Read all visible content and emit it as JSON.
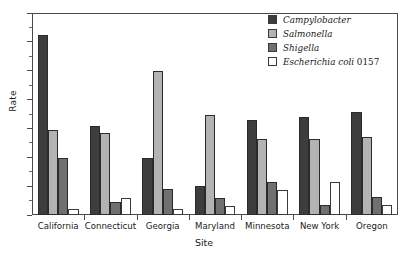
{
  "chart_data": {
    "type": "bar",
    "title": "",
    "xlabel": "Site",
    "ylabel": "Rate",
    "categories": [
      "California",
      "Connecticut",
      "Georgia",
      "Maryland",
      "Minnesota",
      "New York",
      "Oregon"
    ],
    "series": [
      {
        "name": "Campylobacter",
        "color": "#3d3d3d",
        "values": [
          31.2,
          15.5,
          9.8,
          5.0,
          16.5,
          17.0,
          17.8
        ]
      },
      {
        "name": "Salmonella",
        "color": "#b3b3b3",
        "values": [
          14.7,
          14.2,
          25.0,
          17.3,
          13.2,
          13.2,
          13.5
        ]
      },
      {
        "name": "Shigella",
        "color": "#707070",
        "values": [
          9.8,
          2.2,
          4.5,
          3.0,
          5.8,
          1.8,
          3.2
        ]
      },
      {
        "name": "Escherichia coli 0157",
        "color": "#ffffff",
        "values": [
          1.0,
          3.0,
          1.0,
          1.5,
          4.3,
          5.8,
          1.8
        ]
      }
    ],
    "ylim": [
      0,
      35
    ],
    "ytick_labels": [
      "0",
      "5",
      "10",
      "15",
      "20",
      "25",
      "30",
      "35"
    ],
    "ytick_values": [
      0,
      5,
      10,
      15,
      20,
      25,
      30,
      35
    ],
    "yminor_step": 2.5,
    "grid": false,
    "legend_position": "top-right",
    "legend_entries": [
      {
        "label": "Campylobacter",
        "color": "#3d3d3d"
      },
      {
        "label": "Salmonella",
        "color": "#b3b3b3"
      },
      {
        "label": "Shigella",
        "color": "#707070"
      },
      {
        "label": "Escherichia coli 0157",
        "color": "#ffffff"
      }
    ]
  }
}
